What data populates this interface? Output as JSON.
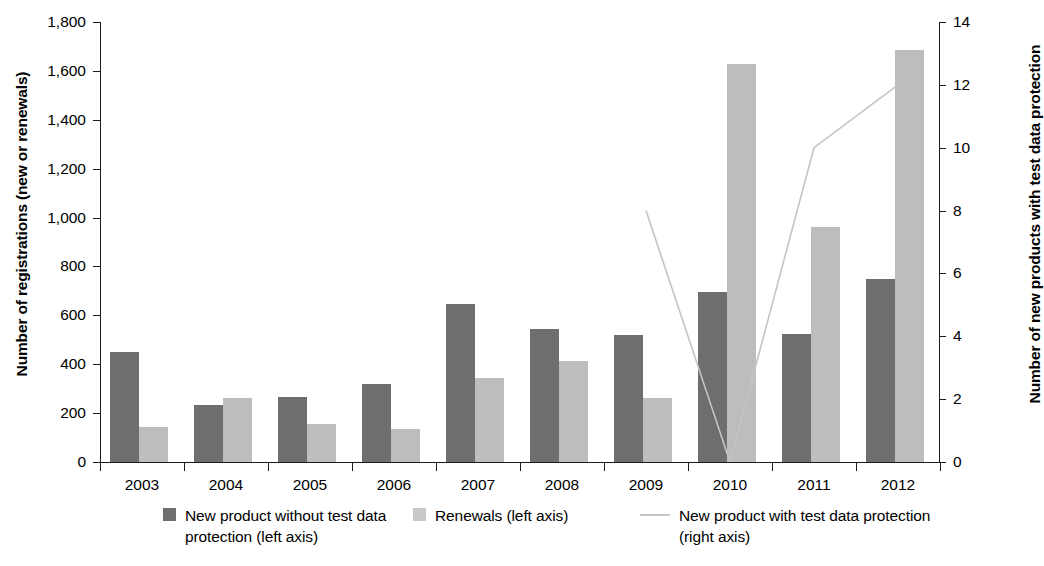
{
  "chart_data": {
    "type": "bar",
    "title": "",
    "subtitle": "",
    "xlabel": "",
    "ylabel": "Number of registrations (new or renewals)",
    "y2label": "Number of new products with test data protection",
    "categories": [
      "2003",
      "2004",
      "2005",
      "2006",
      "2007",
      "2008",
      "2009",
      "2010",
      "2011",
      "2012"
    ],
    "ylim": [
      0,
      1800
    ],
    "y2lim": [
      0,
      14
    ],
    "yticks": [
      "0",
      "200",
      "400",
      "600",
      "800",
      "1,000",
      "1,200",
      "1,400",
      "1,600",
      "1,800"
    ],
    "ytick_values": [
      0,
      200,
      400,
      600,
      800,
      1000,
      1200,
      1400,
      1600,
      1800
    ],
    "y2ticks": [
      "0",
      "2",
      "4",
      "6",
      "8",
      "10",
      "12",
      "14"
    ],
    "y2tick_values": [
      0,
      2,
      4,
      6,
      8,
      10,
      12,
      14
    ],
    "grid": false,
    "legend_position": "bottom",
    "series": [
      {
        "name": "New product without test data protection (left axis)",
        "kind": "bar",
        "axis": "left",
        "color": "#6e6e6e",
        "values": [
          450,
          235,
          265,
          320,
          645,
          545,
          520,
          695,
          525,
          750
        ]
      },
      {
        "name": "Renewals (left axis)",
        "kind": "bar",
        "axis": "left",
        "color": "#bdbdbd",
        "values": [
          145,
          260,
          155,
          135,
          345,
          415,
          260,
          1630,
          960,
          1685
        ]
      },
      {
        "name": "New product with test data protection (right axis)",
        "kind": "line",
        "axis": "right",
        "color": "#c4c4c4",
        "values": [
          null,
          null,
          null,
          null,
          null,
          null,
          8,
          0,
          10,
          12
        ]
      }
    ]
  },
  "axes": {
    "left_title": "Number of registrations (new or renewals)",
    "right_title": "Number of new products with test data protection"
  },
  "legend": {
    "items": [
      {
        "label": "New product without test\ndata protection (left axis)",
        "swatch": "dark-square-swatch"
      },
      {
        "label": "Renewals (left axis)",
        "swatch": "light-square-swatch"
      },
      {
        "label": "New product with test data\nprotection (right axis)",
        "swatch": "line-swatch"
      }
    ]
  }
}
